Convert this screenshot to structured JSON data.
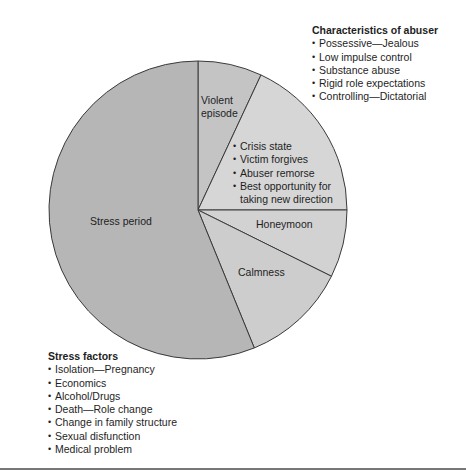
{
  "chart_data": {
    "type": "pie",
    "title": "",
    "start_angle_deg": -90,
    "direction": "clockwise",
    "center": [
      198,
      210
    ],
    "radius": 149,
    "slices": [
      {
        "label": "Violent episode",
        "degrees": 25.0,
        "color": "#c4c4c4"
      },
      {
        "label": "Crisis state / Victim forgives / Abuser remorse / Best opportunity for taking new direction",
        "degrees": 65.0,
        "color": "#d6d6d6"
      },
      {
        "label": "Honeymoon",
        "degrees": 26.4,
        "color": "#d2d2d2"
      },
      {
        "label": "Calmness",
        "degrees": 41.4,
        "color": "#cdcdcd"
      },
      {
        "label": "Stress period",
        "degrees": 202.2,
        "color": "#b6b6b6"
      }
    ],
    "outline_color": "#3a3a3a"
  },
  "slice_labels": {
    "violent_line1": "Violent",
    "violent_line2": "episode",
    "honeymoon": "Honeymoon",
    "calmness": "Calmness",
    "stress_period": "Stress period"
  },
  "crisis_list": [
    "Crisis state",
    "Victim forgives",
    "Abuser remorse",
    "Best opportunity for",
    "taking new direction"
  ],
  "abuser": {
    "heading": "Characteristics of abuser",
    "items": [
      "Possessive—Jealous",
      "Low impulse control",
      "Substance abuse",
      "Rigid role expectations",
      "Controlling—Dictatorial"
    ]
  },
  "stress": {
    "heading": "Stress factors",
    "items": [
      "Isolation—Pregnancy",
      "Economics",
      "Alcohol/Drugs",
      "Death—Role change",
      "Change in family structure",
      "Sexual disfunction",
      "Medical problem"
    ]
  }
}
